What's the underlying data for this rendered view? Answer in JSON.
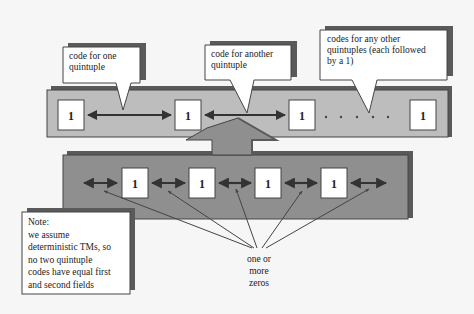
{
  "diagram": {
    "type": "tape-encoding-diagram",
    "colors": {
      "background": "#f6f6f6",
      "top_band": "#bdbdbd",
      "bottom_band": "#8f8f8f",
      "shadow": "#5a5a5a",
      "box_fill": "#ffffff",
      "arrow": "#333333"
    },
    "top_band": {
      "cells": [
        "1",
        "1",
        "1",
        "1"
      ],
      "ellipsis_dots": 5
    },
    "bottom_band": {
      "cells": [
        "1",
        "1",
        "1",
        "1"
      ]
    },
    "callouts": [
      {
        "id": "callout-one",
        "lines": [
          "code for one",
          "quintuple"
        ]
      },
      {
        "id": "callout-another",
        "lines": [
          "code for another",
          "quintuple"
        ]
      },
      {
        "id": "callout-others",
        "lines": [
          "codes for any other",
          "quintuples (each followed",
          "by a 1)"
        ]
      }
    ],
    "note": {
      "lines": [
        "Note:",
        "we assume",
        "deterministic TMs, so",
        "no two quintuple",
        "codes have equal first",
        "and second fields"
      ]
    },
    "zeros_label": {
      "lines": [
        "one or",
        "more",
        "zeros"
      ]
    }
  }
}
